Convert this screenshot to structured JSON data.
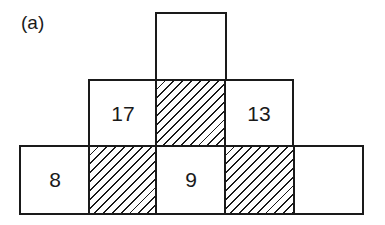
{
  "label": "(a)",
  "colors": {
    "line": "#1a1a1a",
    "background": "#ffffff"
  },
  "pyramid": {
    "rows": [
      {
        "name": "top",
        "cells": [
          {
            "value": "",
            "hatched": false
          }
        ]
      },
      {
        "name": "middle",
        "cells": [
          {
            "value": "17",
            "hatched": false
          },
          {
            "value": "",
            "hatched": true
          },
          {
            "value": "13",
            "hatched": false
          }
        ]
      },
      {
        "name": "bottom",
        "cells": [
          {
            "value": "8",
            "hatched": false
          },
          {
            "value": "",
            "hatched": true
          },
          {
            "value": "9",
            "hatched": false
          },
          {
            "value": "",
            "hatched": true
          },
          {
            "value": "",
            "hatched": false
          }
        ]
      }
    ]
  }
}
